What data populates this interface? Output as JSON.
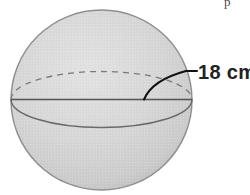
{
  "figure": {
    "kind": "sphere-diagram",
    "background_color": "#ffffff",
    "sphere": {
      "name": "sphere-body",
      "center_x": 101.5,
      "center_y": 100,
      "radius_x": 90.5,
      "radius_y": 90,
      "fill_light": "#dcdcdc",
      "fill_mid": "#d0d0d0",
      "fill_edge": "#b4b4b4",
      "outline_color": "#8f8f8f",
      "outline_width": 1.4
    },
    "equator": {
      "name": "equator-ellipse",
      "ellipse_ry": 28,
      "back_arc_style": "dashed",
      "front_arc_style": "solid",
      "stroke_color": "#6e6e6e",
      "dash_pattern": "6 5"
    },
    "diameter_line": {
      "name": "diameter-line",
      "y": 99.5,
      "x_start": 11,
      "x_end": 192,
      "stroke_color": "#555555",
      "stroke_width": 1.6
    },
    "leader": {
      "name": "radius-leader-line",
      "start_x": 144,
      "start_y": 99,
      "end_x": 186,
      "end_y": 71,
      "stroke_color": "#111111",
      "stroke_width": 2.1,
      "tick_x_start": 186,
      "tick_x_end": 197,
      "tick_y": 71
    },
    "label": {
      "name": "radius-label",
      "text": "18 cm",
      "value": 18,
      "unit": "cm",
      "measures": "radius",
      "x": 198,
      "y": 79,
      "color": "#232323"
    },
    "page_artifact": {
      "name": "cropped-glyph-artifact",
      "text": "p",
      "x": 224,
      "y": 8
    }
  }
}
